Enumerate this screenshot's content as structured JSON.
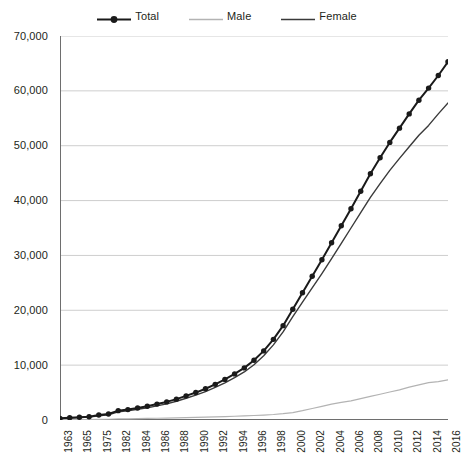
{
  "legend": {
    "position": "top-center",
    "entries": [
      {
        "label": "Total",
        "color": "#1a1a1a",
        "width": 2.2,
        "marker": "circle"
      },
      {
        "label": "Male",
        "color": "#b3b3b3",
        "width": 1.2,
        "marker": "none"
      },
      {
        "label": "Female",
        "color": "#3a3a3a",
        "width": 1.4,
        "marker": "none"
      }
    ]
  },
  "colors": {
    "total": "#1a1a1a",
    "male": "#b3b3b3",
    "female": "#3a3a3a",
    "gridline": "#c8c8c8",
    "axis": "#6e6e6e",
    "text": "#231f20",
    "background": "#ffffff"
  },
  "chart_data": {
    "type": "line",
    "title": "",
    "subtitle": "",
    "xlabel": "",
    "ylabel": "",
    "ylim": [
      0,
      70000
    ],
    "ytick_step": 10000,
    "ytick_labels": [
      "70,000",
      "60,000",
      "50,000",
      "40,000",
      "30,000",
      "20,000",
      "10,000",
      "0"
    ],
    "ytick_values": [
      70000,
      60000,
      50000,
      40000,
      30000,
      20000,
      10000,
      0
    ],
    "grid": "horizontal",
    "legend_position": "top-center",
    "x_axis_type": "category",
    "categories": [
      "1963",
      "1964",
      "1965",
      "1966",
      "1975",
      "1976",
      "1982",
      "1983",
      "1984",
      "1985",
      "1986",
      "1987",
      "1988",
      "1989",
      "1990",
      "1991",
      "1992",
      "1993",
      "1994",
      "1995",
      "1996",
      "1997",
      "1998",
      "1999",
      "2000",
      "2001",
      "2002",
      "2003",
      "2004",
      "2005",
      "2006",
      "2007",
      "2008",
      "2009",
      "2010",
      "2011",
      "2012",
      "2013",
      "2014",
      "2015",
      "2016"
    ],
    "xtick_labels_shown": [
      "1963",
      "1965",
      "1975",
      "1982",
      "1984",
      "1986",
      "1988",
      "1990",
      "1992",
      "1994",
      "1996",
      "1998",
      "2000",
      "2002",
      "2004",
      "2006",
      "2008",
      "2010",
      "2012",
      "2014",
      "2016"
    ],
    "series": [
      {
        "name": "Total",
        "color": "#1a1a1a",
        "markers": true,
        "values": [
          300,
          400,
          500,
          600,
          900,
          1100,
          1700,
          1900,
          2200,
          2500,
          2900,
          3300,
          3800,
          4400,
          5000,
          5700,
          6500,
          7400,
          8400,
          9500,
          10900,
          12600,
          14700,
          17200,
          20200,
          23200,
          26200,
          29200,
          32300,
          35400,
          38500,
          41700,
          44900,
          47800,
          50600,
          53200,
          55800,
          58300,
          60500,
          62800,
          65300
        ]
      },
      {
        "name": "Male",
        "color": "#b3b3b3",
        "markers": false,
        "values": [
          50,
          60,
          70,
          80,
          120,
          140,
          200,
          220,
          250,
          280,
          320,
          350,
          390,
          430,
          470,
          520,
          570,
          620,
          680,
          740,
          820,
          900,
          1000,
          1150,
          1350,
          1700,
          2100,
          2500,
          2900,
          3200,
          3500,
          3900,
          4300,
          4700,
          5100,
          5500,
          6000,
          6400,
          6800,
          7000,
          7300
        ]
      },
      {
        "name": "Female",
        "color": "#3a3a3a",
        "markers": false,
        "values": [
          250,
          340,
          430,
          520,
          780,
          960,
          1500,
          1680,
          1950,
          2220,
          2580,
          2950,
          3410,
          3970,
          4530,
          5180,
          5930,
          6780,
          7720,
          8760,
          10080,
          11700,
          13700,
          16050,
          18850,
          21500,
          24100,
          26700,
          29400,
          32200,
          35000,
          37800,
          40600,
          43100,
          45500,
          47700,
          49800,
          51900,
          53700,
          55800,
          57800
        ]
      }
    ]
  }
}
